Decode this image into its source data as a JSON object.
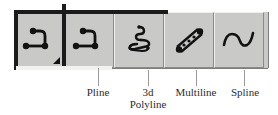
{
  "figure": {
    "kind": "autocad-draw-toolbar-annotated",
    "background_color": "#ffffff"
  },
  "toolbar": {
    "name": "Draw toolbar",
    "face_color": "#c9c9c7",
    "highlight_color": "#efefed",
    "shadow_color": "#8a8a88",
    "flyout_border_color": "#1b1b1b",
    "buttons": [
      {
        "id": "pline-flyout",
        "label": "Pline",
        "icon": "polyline-icon",
        "has_flyout_arrow": true,
        "flyout_marker": "◢",
        "selected": true
      },
      {
        "id": "pline",
        "label": "Pline",
        "icon": "polyline-icon",
        "has_flyout_arrow": false,
        "selected": true
      },
      {
        "id": "3d-polyline",
        "label": "3d Polyline",
        "label_line1": "3d",
        "label_line2": "Polyline",
        "icon": "3d-polyline-icon",
        "has_flyout_arrow": false,
        "selected": false
      },
      {
        "id": "multiline",
        "label": "Multiline",
        "icon": "multiline-icon",
        "has_flyout_arrow": false,
        "selected": false
      },
      {
        "id": "spline",
        "label": "Spline",
        "icon": "spline-icon",
        "has_flyout_arrow": false,
        "selected": false
      }
    ]
  },
  "annotations": {
    "leader_color": "#9a9a98",
    "text_color": "#2c2c2c",
    "callouts": [
      {
        "id": "callout-pline",
        "text": "Pline"
      },
      {
        "id": "callout-3d",
        "text": "3d",
        "text2": "Polyline"
      },
      {
        "id": "callout-multiline",
        "text": "Multiline"
      },
      {
        "id": "callout-spline",
        "text": "Spline"
      }
    ]
  }
}
